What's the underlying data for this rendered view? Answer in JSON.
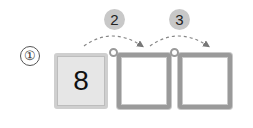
{
  "problem": {
    "label": "①",
    "boxes": [
      {
        "value": "8",
        "filled": true
      },
      {
        "value": "",
        "filled": false
      },
      {
        "value": "",
        "filled": false
      }
    ],
    "steps": [
      {
        "label": "2"
      },
      {
        "label": "3"
      }
    ]
  },
  "colors": {
    "filled_box": "#e6e6e6",
    "border": "#9a9a9a",
    "badge": "#c8c8c8"
  }
}
